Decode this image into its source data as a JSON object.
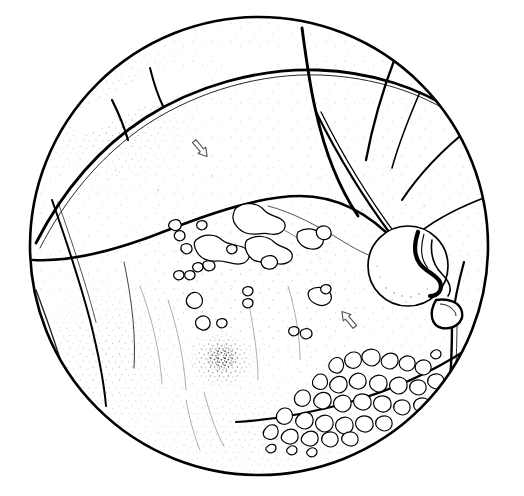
{
  "figure": {
    "kind": "retinal-fundus-drawing",
    "title": "Fundus drawing of retina",
    "canvas": {
      "width": 524,
      "height": 496
    },
    "background_color": "#ffffff",
    "ink_color": "#000000",
    "stipple_color": "#1a1a1a"
  },
  "globe": {
    "name": "fundus-circle",
    "center_x": 259,
    "center_y": 246,
    "radius": 230,
    "rim_stroke_width": 2.6,
    "rim_color": "#000000"
  },
  "optic_disc": {
    "name": "optic-disc",
    "center_x": 408,
    "center_y": 266,
    "radius_x": 40,
    "radius_y": 39,
    "stroke_width": 1.6,
    "cup_present": true,
    "cup_label": "physiologic cup"
  },
  "macula": {
    "name": "macula",
    "center_x": 222,
    "center_y": 360,
    "radius": 26,
    "pigment_density": "dense",
    "foveal_reflex": true
  },
  "vessels": [
    {
      "id": "superior-arcade-main",
      "label": "superior temporal arcade",
      "width": 2.8
    },
    {
      "id": "inferior-arcade-main",
      "label": "inferior temporal arcade",
      "width": 2.6
    },
    {
      "id": "superior-nasal-branch",
      "label": "superior nasal branch",
      "width": 2.2
    },
    {
      "id": "inferior-nasal-branch",
      "label": "inferior nasal branch",
      "width": 2.0
    },
    {
      "id": "disc-emerging-pair",
      "label": "vessel pair emerging from disc",
      "width": 2.0
    },
    {
      "id": "thin-venule-superior",
      "label": "thin venule toward disc",
      "width": 0.9
    },
    {
      "id": "peripheral-right-vessel",
      "label": "peripheral vessel right",
      "width": 2.2
    },
    {
      "id": "peripheral-left-vessel",
      "label": "peripheral vessel left",
      "width": 2.0
    }
  ],
  "arrow_markers": [
    {
      "id": "arrow-upper-left",
      "x": 200,
      "y": 148,
      "rotation": 140,
      "style": "hollow-outline",
      "points_to": "superior retinal finding"
    },
    {
      "id": "arrow-lower-right",
      "x": 349,
      "y": 320,
      "rotation": -40,
      "style": "hollow-outline",
      "points_to": "inferior retinal finding"
    }
  ],
  "lesion_groups": [
    {
      "id": "drusen-cluster-central",
      "label": "drusen / hard exudate cluster",
      "style": "outlined-cloud",
      "count": 18,
      "region": "central posterior pole"
    },
    {
      "id": "pigmented-lesion-cluster-inferotemporal",
      "label": "pigmented chorioretinal lesion cluster",
      "style": "outlined-irregular",
      "count": 52,
      "region": "inferotemporal periphery"
    }
  ],
  "shading_zones": [
    {
      "id": "periphery-stipple",
      "label": "peripheral pigment stipple",
      "density": "high"
    },
    {
      "id": "mid-stipple",
      "label": "mid-peripheral stipple",
      "density": "medium"
    },
    {
      "id": "posterior-stipple",
      "label": "posterior pole stipple",
      "density": "low"
    }
  ]
}
